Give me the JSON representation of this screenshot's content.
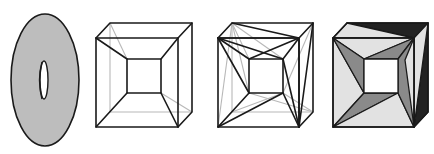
{
  "figure": {
    "panels": [
      {
        "id": "torus",
        "label": "torus surface",
        "fill": "#bdbdbd",
        "outline": "#1a1a1a",
        "outer": {
          "cx": 45,
          "cy": 80,
          "rx": 34,
          "ry": 66
        },
        "hole": {
          "cx": 44,
          "cy": 80,
          "rx": 4,
          "ry": 19
        }
      },
      {
        "id": "polyhedral-torus-wireframe",
        "label": "polyhedral torus (square frame) wireframe",
        "front_outer": [
          [
            96,
            38
          ],
          [
            178,
            38
          ],
          [
            178,
            127
          ],
          [
            96,
            127
          ]
        ],
        "back_outer": [
          [
            110,
            23
          ],
          [
            192,
            23
          ],
          [
            192,
            112
          ],
          [
            110,
            112
          ]
        ],
        "inner": [
          [
            127,
            59
          ],
          [
            161,
            59
          ],
          [
            161,
            93
          ],
          [
            127,
            93
          ]
        ]
      },
      {
        "id": "triangulated-torus-wireframe",
        "label": "triangulated polyhedral torus wireframe",
        "front_outer": [
          [
            218,
            38
          ],
          [
            299,
            38
          ],
          [
            299,
            127
          ],
          [
            218,
            127
          ]
        ],
        "back_outer": [
          [
            232,
            23
          ],
          [
            313,
            23
          ],
          [
            313,
            112
          ],
          [
            232,
            112
          ]
        ],
        "inner": [
          [
            249,
            59
          ],
          [
            283,
            59
          ],
          [
            283,
            93
          ],
          [
            249,
            93
          ]
        ]
      },
      {
        "id": "triangulated-torus-shaded",
        "label": "triangulated polyhedral torus shaded",
        "colors": {
          "light": "#e2e2e2",
          "mid": "#8a8a8a",
          "dark": "#222222",
          "hole": "#ffffff"
        },
        "front_outer": [
          [
            333,
            38
          ],
          [
            414,
            38
          ],
          [
            414,
            127
          ],
          [
            333,
            127
          ]
        ],
        "back_outer": [
          [
            347,
            23
          ],
          [
            428,
            23
          ],
          [
            428,
            112
          ],
          [
            347,
            112
          ]
        ],
        "inner": [
          [
            364,
            59
          ],
          [
            398,
            59
          ],
          [
            398,
            93
          ],
          [
            364,
            93
          ]
        ]
      }
    ]
  }
}
